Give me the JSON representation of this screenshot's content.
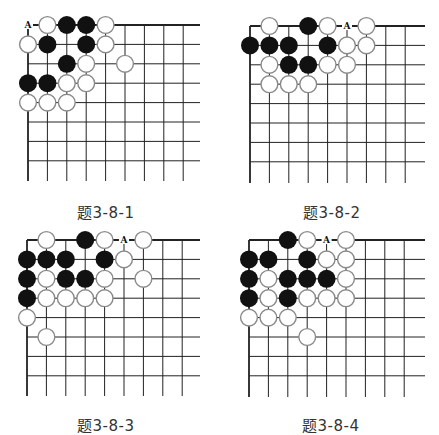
{
  "grid": {
    "cols": 9,
    "rows": 8,
    "spacing": 19.4,
    "stone_radius": 9,
    "line_color": "#222222",
    "white_stone_fill": "#ffffff",
    "white_stone_stroke": "#8a8a8a",
    "black_stone_fill": "#111111"
  },
  "boards": [
    {
      "caption": "题3-8-1",
      "origin": [
        28,
        25
      ],
      "line_extent": [
        200,
        181
      ],
      "caption_pos": [
        77,
        201
      ],
      "label": {
        "text": "A",
        "col": 0,
        "row": 0
      },
      "stones": [
        {
          "c": 1,
          "r": 0,
          "color": "W"
        },
        {
          "c": 2,
          "r": 0,
          "color": "B"
        },
        {
          "c": 3,
          "r": 0,
          "color": "B"
        },
        {
          "c": 4,
          "r": 0,
          "color": "W"
        },
        {
          "c": 0,
          "r": 1,
          "color": "W"
        },
        {
          "c": 1,
          "r": 1,
          "color": "B"
        },
        {
          "c": 3,
          "r": 1,
          "color": "B"
        },
        {
          "c": 4,
          "r": 1,
          "color": "W"
        },
        {
          "c": 2,
          "r": 2,
          "color": "B"
        },
        {
          "c": 3,
          "r": 2,
          "color": "W"
        },
        {
          "c": 5,
          "r": 2,
          "color": "W"
        },
        {
          "c": 0,
          "r": 3,
          "color": "B"
        },
        {
          "c": 1,
          "r": 3,
          "color": "B"
        },
        {
          "c": 2,
          "r": 3,
          "color": "W"
        },
        {
          "c": 3,
          "r": 3,
          "color": "W"
        },
        {
          "c": 0,
          "r": 4,
          "color": "W"
        },
        {
          "c": 1,
          "r": 4,
          "color": "W"
        },
        {
          "c": 2,
          "r": 4,
          "color": "W"
        }
      ]
    },
    {
      "caption": "题3-8-2",
      "origin": [
        250,
        26
      ],
      "line_extent": [
        425,
        183
      ],
      "caption_pos": [
        303,
        201
      ],
      "label": {
        "text": "A",
        "col": 5,
        "row": 0
      },
      "stones": [
        {
          "c": 1,
          "r": 0,
          "color": "W"
        },
        {
          "c": 3,
          "r": 0,
          "color": "B"
        },
        {
          "c": 4,
          "r": 0,
          "color": "W"
        },
        {
          "c": 6,
          "r": 0,
          "color": "W"
        },
        {
          "c": 0,
          "r": 1,
          "color": "B"
        },
        {
          "c": 1,
          "r": 1,
          "color": "B"
        },
        {
          "c": 2,
          "r": 1,
          "color": "B"
        },
        {
          "c": 4,
          "r": 1,
          "color": "B"
        },
        {
          "c": 5,
          "r": 1,
          "color": "W"
        },
        {
          "c": 6,
          "r": 1,
          "color": "W"
        },
        {
          "c": 1,
          "r": 2,
          "color": "W"
        },
        {
          "c": 2,
          "r": 2,
          "color": "B"
        },
        {
          "c": 3,
          "r": 2,
          "color": "B"
        },
        {
          "c": 4,
          "r": 2,
          "color": "W"
        },
        {
          "c": 5,
          "r": 2,
          "color": "W"
        },
        {
          "c": 1,
          "r": 3,
          "color": "W"
        },
        {
          "c": 2,
          "r": 3,
          "color": "W"
        },
        {
          "c": 3,
          "r": 3,
          "color": "W"
        }
      ]
    },
    {
      "caption": "题3-8-3",
      "origin": [
        27,
        240
      ],
      "line_extent": [
        200,
        396
      ],
      "caption_pos": [
        77,
        414
      ],
      "label": {
        "text": "A",
        "col": 5,
        "row": 0
      },
      "stones": [
        {
          "c": 1,
          "r": 0,
          "color": "W"
        },
        {
          "c": 3,
          "r": 0,
          "color": "B"
        },
        {
          "c": 4,
          "r": 0,
          "color": "W"
        },
        {
          "c": 6,
          "r": 0,
          "color": "W"
        },
        {
          "c": 0,
          "r": 1,
          "color": "B"
        },
        {
          "c": 1,
          "r": 1,
          "color": "B"
        },
        {
          "c": 2,
          "r": 1,
          "color": "B"
        },
        {
          "c": 4,
          "r": 1,
          "color": "B"
        },
        {
          "c": 5,
          "r": 1,
          "color": "W"
        },
        {
          "c": 0,
          "r": 2,
          "color": "B"
        },
        {
          "c": 1,
          "r": 2,
          "color": "W"
        },
        {
          "c": 2,
          "r": 2,
          "color": "B"
        },
        {
          "c": 3,
          "r": 2,
          "color": "B"
        },
        {
          "c": 4,
          "r": 2,
          "color": "W"
        },
        {
          "c": 6,
          "r": 2,
          "color": "W"
        },
        {
          "c": 0,
          "r": 3,
          "color": "B"
        },
        {
          "c": 1,
          "r": 3,
          "color": "W"
        },
        {
          "c": 2,
          "r": 3,
          "color": "W"
        },
        {
          "c": 3,
          "r": 3,
          "color": "W"
        },
        {
          "c": 4,
          "r": 3,
          "color": "W"
        },
        {
          "c": 0,
          "r": 4,
          "color": "W"
        },
        {
          "c": 1,
          "r": 5,
          "color": "W"
        }
      ]
    },
    {
      "caption": "题3-8-4",
      "origin": [
        249,
        240
      ],
      "line_extent": [
        425,
        397
      ],
      "caption_pos": [
        302,
        414
      ],
      "label": {
        "text": "A",
        "col": 4,
        "row": 0
      },
      "stones": [
        {
          "c": 2,
          "r": 0,
          "color": "B"
        },
        {
          "c": 3,
          "r": 0,
          "color": "W"
        },
        {
          "c": 5,
          "r": 0,
          "color": "W"
        },
        {
          "c": 0,
          "r": 1,
          "color": "B"
        },
        {
          "c": 1,
          "r": 1,
          "color": "B"
        },
        {
          "c": 3,
          "r": 1,
          "color": "B"
        },
        {
          "c": 4,
          "r": 1,
          "color": "W"
        },
        {
          "c": 5,
          "r": 1,
          "color": "W"
        },
        {
          "c": 0,
          "r": 2,
          "color": "B"
        },
        {
          "c": 1,
          "r": 2,
          "color": "W"
        },
        {
          "c": 2,
          "r": 2,
          "color": "B"
        },
        {
          "c": 3,
          "r": 2,
          "color": "B"
        },
        {
          "c": 4,
          "r": 2,
          "color": "B"
        },
        {
          "c": 5,
          "r": 2,
          "color": "W"
        },
        {
          "c": 0,
          "r": 3,
          "color": "B"
        },
        {
          "c": 1,
          "r": 3,
          "color": "W"
        },
        {
          "c": 2,
          "r": 3,
          "color": "B"
        },
        {
          "c": 3,
          "r": 3,
          "color": "W"
        },
        {
          "c": 4,
          "r": 3,
          "color": "W"
        },
        {
          "c": 5,
          "r": 3,
          "color": "W"
        },
        {
          "c": 0,
          "r": 4,
          "color": "W"
        },
        {
          "c": 1,
          "r": 4,
          "color": "W"
        },
        {
          "c": 2,
          "r": 4,
          "color": "W"
        },
        {
          "c": 3,
          "r": 5,
          "color": "W"
        }
      ]
    }
  ]
}
